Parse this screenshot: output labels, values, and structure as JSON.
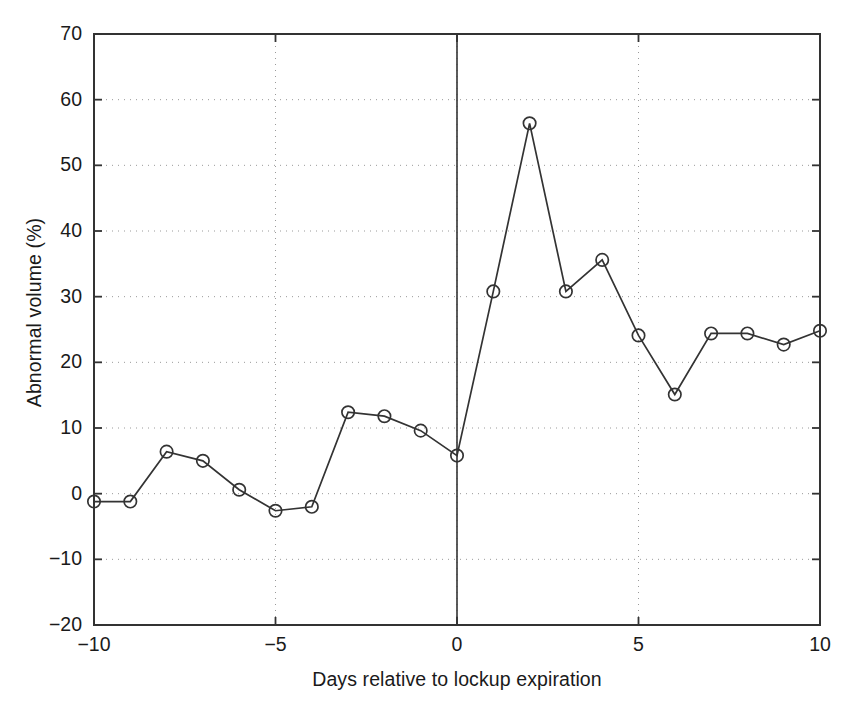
{
  "chart_data": {
    "type": "line",
    "title": "",
    "subtitle": "",
    "xlabel": "Days relative to lockup expiration",
    "ylabel": "Abnormal volume (%)",
    "xlim": [
      -10,
      10
    ],
    "ylim": [
      -20,
      70
    ],
    "grid": true,
    "grid_style": "dotted",
    "legend": null,
    "marker": "open-circle",
    "line_color": "#333333",
    "marker_color": "#333333",
    "annotations": [
      {
        "name": "event-line",
        "type": "vertical-line",
        "x": 0,
        "style": "solid",
        "color": "#333333"
      }
    ],
    "x": [
      -10,
      -9,
      -8,
      -7,
      -6,
      -5,
      -4,
      -3,
      -2,
      -1,
      0,
      1,
      2,
      3,
      4,
      5,
      6,
      7,
      8,
      9,
      10
    ],
    "values": [
      -1.2,
      -1.2,
      6.4,
      5.0,
      0.6,
      -2.6,
      -2.0,
      12.4,
      11.8,
      9.6,
      5.8,
      30.8,
      56.4,
      30.8,
      35.6,
      24.1,
      15.1,
      24.4,
      24.4,
      22.7,
      24.8
    ],
    "xticks": [
      -10,
      -5,
      0,
      5,
      10
    ],
    "xticklabels": [
      "-10",
      "-5",
      "0",
      "5",
      "10"
    ],
    "yticks": [
      -20,
      -10,
      0,
      10,
      20,
      30,
      40,
      50,
      60,
      70
    ],
    "yticklabels": [
      "-20",
      "-10",
      "0",
      "10",
      "20",
      "30",
      "40",
      "50",
      "60",
      "70"
    ]
  },
  "axes": {
    "frame_color": "#333333",
    "background": "#ffffff"
  }
}
